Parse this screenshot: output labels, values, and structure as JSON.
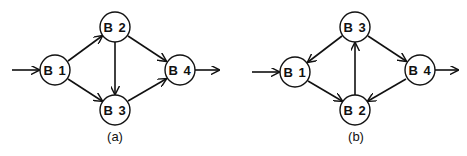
{
  "diagrams": [
    {
      "id": "a",
      "caption": "(a)",
      "nodes": [
        {
          "id": "B1",
          "label": "B 1",
          "x": 55,
          "y": 70
        },
        {
          "id": "B2",
          "label": "B 2",
          "x": 115,
          "y": 27
        },
        {
          "id": "B3",
          "label": "B 3",
          "x": 115,
          "y": 110
        },
        {
          "id": "B4",
          "label": "B 4",
          "x": 180,
          "y": 70
        }
      ],
      "edges": [
        {
          "from": "entry",
          "to": "B1"
        },
        {
          "from": "B1",
          "to": "B2"
        },
        {
          "from": "B1",
          "to": "B3"
        },
        {
          "from": "B2",
          "to": "B3"
        },
        {
          "from": "B2",
          "to": "B4"
        },
        {
          "from": "B3",
          "to": "B4"
        },
        {
          "from": "B4",
          "to": "exit"
        }
      ]
    },
    {
      "id": "b",
      "caption": "(b)",
      "nodes": [
        {
          "id": "B1",
          "label": "B 1",
          "x": 295,
          "y": 72
        },
        {
          "id": "B3",
          "label": "B 3",
          "x": 355,
          "y": 27
        },
        {
          "id": "B2",
          "label": "B 2",
          "x": 355,
          "y": 110
        },
        {
          "id": "B4",
          "label": "B 4",
          "x": 420,
          "y": 70
        }
      ],
      "edges": [
        {
          "from": "entry",
          "to": "B1"
        },
        {
          "from": "B3",
          "to": "B1"
        },
        {
          "from": "B1",
          "to": "B2"
        },
        {
          "from": "B2",
          "to": "B3"
        },
        {
          "from": "B3",
          "to": "B4"
        },
        {
          "from": "B4",
          "to": "B2"
        },
        {
          "from": "B4",
          "to": "exit"
        }
      ]
    }
  ],
  "style": {
    "stroke_color": "#111111",
    "node_fill": "#ffffff",
    "background": "#ffffff",
    "node_radius": 15
  }
}
